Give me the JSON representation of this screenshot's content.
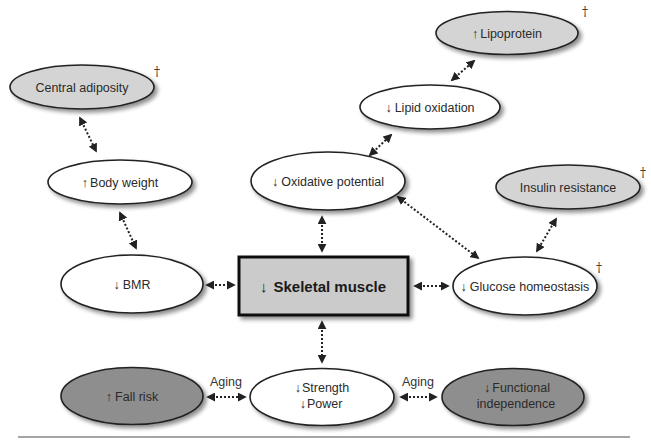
{
  "colors": {
    "white_node": "#ffffff",
    "light_node": "#d4d4d4",
    "dark_node": "#8e8e8e",
    "center_box": "#cbcbcb",
    "stroke": "#222222",
    "divider": "#888888"
  },
  "center": {
    "label": "Skeletal muscle",
    "arrow": "↓"
  },
  "nodes": {
    "lipoprotein": {
      "label": "Lipoprotein",
      "arrow": "↑",
      "mark": "†"
    },
    "central_adiposity": {
      "label": "Central adiposity",
      "arrow": "",
      "mark": "†"
    },
    "lipid_oxidation": {
      "label": "Lipid oxidation",
      "arrow": "↓"
    },
    "body_weight": {
      "label": "Body weight",
      "arrow": "↑"
    },
    "oxidative_potential": {
      "label": "Oxidative potential",
      "arrow": "↓"
    },
    "insulin_resistance": {
      "label": "Insulin resistance",
      "arrow": "",
      "mark": "†"
    },
    "bmr": {
      "label": "BMR",
      "arrow": "↓"
    },
    "glucose_homeostasis": {
      "label": "Glucose homeostasis",
      "arrow": "↓",
      "mark": "†"
    },
    "fall_risk": {
      "label": "Fall risk",
      "arrow": "↑"
    },
    "strength_power": {
      "line1": "Strength",
      "line2": "Power",
      "arrow1": "↓",
      "arrow2": "↓"
    },
    "functional_independence": {
      "line1": "Functional",
      "line2": "independence",
      "arrow": "↓"
    }
  },
  "edge_labels": {
    "aging_left": "Aging",
    "aging_right": "Aging"
  },
  "edges": [
    [
      "central_adiposity",
      "body_weight"
    ],
    [
      "body_weight",
      "bmr"
    ],
    [
      "lipid_oxidation",
      "lipoprotein"
    ],
    [
      "oxidative_potential",
      "lipid_oxidation"
    ],
    [
      "oxidative_potential",
      "skeletal_muscle"
    ],
    [
      "oxidative_potential",
      "glucose_homeostasis"
    ],
    [
      "insulin_resistance",
      "glucose_homeostasis"
    ],
    [
      "bmr",
      "skeletal_muscle"
    ],
    [
      "skeletal_muscle",
      "glucose_homeostasis"
    ],
    [
      "skeletal_muscle",
      "strength_power"
    ],
    [
      "fall_risk",
      "strength_power"
    ],
    [
      "strength_power",
      "functional_independence"
    ]
  ]
}
